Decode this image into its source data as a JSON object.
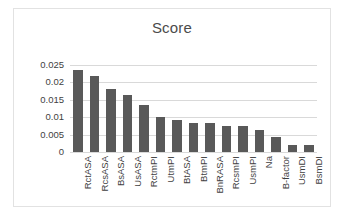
{
  "chart_data": {
    "type": "bar",
    "title": "Score",
    "xlabel": "",
    "ylabel": "",
    "ylim": [
      0,
      0.025
    ],
    "grid": true,
    "legend": false,
    "y_ticks": [
      "0.025",
      "0.02",
      "0.015",
      "0.01",
      "0.005",
      "0"
    ],
    "y_tick_values": [
      0.025,
      0.02,
      0.015,
      0.01,
      0.005,
      0
    ],
    "categories": [
      "RctASA",
      "RcsASA",
      "BsASA",
      "UsASA",
      "RctmPI",
      "UtmPI",
      "BtASA",
      "BtmPI",
      "BnRASA",
      "RcsmPI",
      "UsmPI",
      "Na",
      "B-factor",
      "UsmDI",
      "BsmDI"
    ],
    "values": [
      0.0235,
      0.0217,
      0.0181,
      0.0164,
      0.0134,
      0.0101,
      0.0093,
      0.0082,
      0.0082,
      0.0075,
      0.0075,
      0.0062,
      0.0044,
      0.002,
      0.002
    ],
    "bar_color": "#595959",
    "grid_color": "#d9d9d9",
    "text_color": "#3f3f3f"
  }
}
